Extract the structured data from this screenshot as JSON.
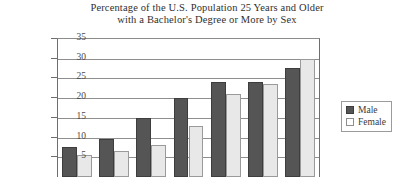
{
  "chart_data": {
    "type": "bar",
    "title": "Percentage of the U.S. Population 25 Years and Older with a Bachelor's Degree or More by Sex",
    "title_lines": [
      "Percentage of the U.S. Population 25 Years and Older",
      "with a Bachelor's Degree or More by Sex"
    ],
    "xlabel": "",
    "ylabel": "",
    "ylim": [
      0,
      35
    ],
    "yticks": [
      5,
      10,
      15,
      20,
      25,
      30,
      35
    ],
    "grid": true,
    "legend_position": "right",
    "categories": [
      "1",
      "2",
      "3",
      "4",
      "5",
      "6",
      "7"
    ],
    "series": [
      {
        "name": "Male",
        "color": "#555555",
        "values": [
          7.5,
          9.7,
          15.0,
          20.0,
          24.0,
          24.0,
          27.7
        ]
      },
      {
        "name": "Female",
        "color": "#e8e8e8",
        "values": [
          5.5,
          6.5,
          8.0,
          13.0,
          21.0,
          23.5,
          30.0
        ]
      }
    ]
  },
  "legend": {
    "items": [
      {
        "label": "Male",
        "swatch": "male-swatch-icon"
      },
      {
        "label": "Female",
        "swatch": "female-swatch-icon"
      }
    ]
  }
}
